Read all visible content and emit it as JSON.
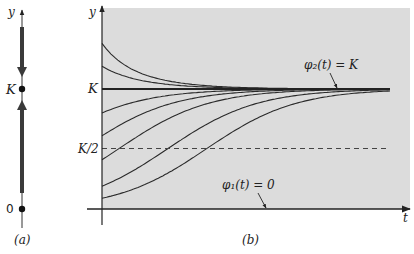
{
  "panel_a": {
    "caption": "(a)",
    "axis_label": "y",
    "points": [
      {
        "label": "K",
        "value_frac_K": 1
      },
      {
        "label": "0",
        "value_frac_K": 0
      }
    ],
    "flow": [
      {
        "from": "above K",
        "direction": "down"
      },
      {
        "from": "between 0 and K",
        "direction": "up"
      }
    ]
  },
  "panel_b": {
    "caption": "(b)",
    "y_axis_label": "y",
    "x_axis_label": "t",
    "y_ticks": [
      {
        "label": "K",
        "frac_K": 1
      },
      {
        "label": "K/2",
        "frac_K": 0.5
      }
    ],
    "annotations": {
      "phi2": "φ₂(t) = K",
      "phi1": "φ₁(t) = 0"
    },
    "background": "#dcdcdc"
  },
  "chart_data": {
    "type": "line",
    "title": "",
    "xlabel": "t",
    "ylabel": "y",
    "model": "logistic: y = K / (1 + ((K - y0)/y0) * exp(-r t))",
    "K": 1,
    "r": 1,
    "t_range": [
      0,
      6.4
    ],
    "ylim": [
      0,
      1.45
    ],
    "grid": false,
    "reference_lines": [
      {
        "name": "K/2",
        "y": 0.5,
        "style": "dashed"
      }
    ],
    "equilibria": [
      {
        "name": "φ₂(t) = K",
        "y": 1
      },
      {
        "name": "φ₁(t) = 0",
        "y": 0
      }
    ],
    "series": [
      {
        "name": "y0=1.38K",
        "y0": 1.38
      },
      {
        "name": "y0=1.19K",
        "y0": 1.19
      },
      {
        "name": "y0=0.80K",
        "y0": 0.8
      },
      {
        "name": "y0=0.61K",
        "y0": 0.61
      },
      {
        "name": "y0=0.41K",
        "y0": 0.41
      },
      {
        "name": "y0=0.19K",
        "y0": 0.19
      },
      {
        "name": "y0=0.09K",
        "y0": 0.09
      }
    ]
  }
}
